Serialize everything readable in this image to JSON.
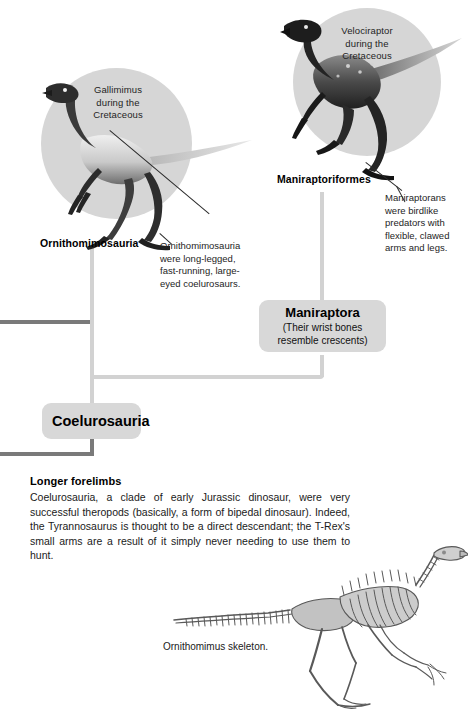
{
  "diagram": {
    "figures": [
      {
        "id": "gallimimus",
        "caption": "Gallimimus\nduring the\nCretaceous",
        "caption_lines": [
          "Gallimimus",
          "during the",
          "Cretaceous"
        ],
        "taxon_label": "Ornithomimosauria"
      },
      {
        "id": "velociraptor",
        "caption_lines": [
          "Velociraptor",
          "during the",
          "Cretaceous"
        ],
        "taxon_label": "Maniraptoriformes"
      }
    ],
    "notes": [
      {
        "id": "ornithomimosauria-note",
        "lines": [
          "Ornithomimosauria",
          "were long-legged,",
          "fast-running, large-",
          "eyed coelurosaurs."
        ]
      },
      {
        "id": "maniraptorans-note",
        "lines": [
          "Maniraptorans",
          "were birdlike",
          "predators with",
          "flexible, clawed",
          "arms and legs."
        ]
      }
    ],
    "clades": [
      {
        "id": "maniraptora",
        "title": "Maniraptora",
        "subtitle_lines": [
          "(Their wrist bones",
          "resemble crescents)"
        ]
      },
      {
        "id": "coelurosauria",
        "title": "Coelurosauria",
        "subtitle_lines": []
      }
    ]
  },
  "article": {
    "heading": "Longer forelimbs",
    "body": "Coelurosauria, a clade of early Jurassic dinosaur, were very successful theropods (basically, a form of bipedal dinosaur). Indeed, the Tyrannosaurus is thought to be a direct descendant; the T-Rex's small arms are a result of it simply never needing to use them to hunt."
  },
  "skeleton": {
    "caption": "Ornithomimus skeleton."
  },
  "colors": {
    "circle_backdrop": "#d6d6d6",
    "clade_box": "#d8d8d8",
    "connector_light": "#d2d2d2",
    "connector_dark": "#7a7a7a",
    "text": "#1a1a1a",
    "page_background": "#ffffff"
  }
}
